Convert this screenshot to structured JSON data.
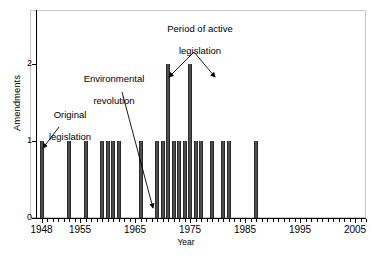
{
  "chart_data": {
    "type": "bar",
    "title": "",
    "xlabel": "Year",
    "ylabel": "Amendments",
    "xlim": [
      1947,
      2007
    ],
    "ylim": [
      0,
      2.7
    ],
    "yticks": [
      0,
      1,
      2
    ],
    "ytick_labels": [
      "0",
      "1",
      "2"
    ],
    "xtick_labels": [
      "1948",
      "1955",
      "1965",
      "1975",
      "1985",
      "1995",
      "2005"
    ],
    "xtick_values": [
      1948,
      1955,
      1965,
      1975,
      1985,
      1995,
      2005
    ],
    "grid": false,
    "legend": null,
    "bar_color": "#2b2b2b",
    "categories": [
      1948,
      1953,
      1956,
      1959,
      1960,
      1961,
      1962,
      1966,
      1969,
      1970,
      1971,
      1972,
      1973,
      1974,
      1975,
      1976,
      1977,
      1979,
      1981,
      1982,
      1987
    ],
    "values": [
      1,
      1,
      1,
      1,
      1,
      1,
      1,
      1,
      1,
      1,
      2,
      1,
      1,
      1,
      2,
      1,
      1,
      1,
      1,
      1,
      1
    ],
    "annotations": [
      {
        "id": "original-legislation",
        "text": "Original\nlegislation",
        "points_to_year": 1948,
        "points_to_value": 1
      },
      {
        "id": "environmental-revolution",
        "text": "Environmental\nrevolution",
        "points_to_year": 1969,
        "points_to_value": 0
      },
      {
        "id": "period-of-active-legislation",
        "text": "Period of active\nlegislation",
        "points_to_year": 1971,
        "points_to_value": 2
      }
    ]
  },
  "axes": {
    "y_title": "Amendments",
    "x_title": "Year",
    "y_ticks": [
      {
        "label": "2",
        "value": 2
      },
      {
        "label": "1",
        "value": 1
      },
      {
        "label": "0",
        "value": 0
      }
    ],
    "x_ticks": [
      {
        "label": "1948",
        "value": 1948
      },
      {
        "label": "1955",
        "value": 1955
      },
      {
        "label": "1965",
        "value": 1965
      },
      {
        "label": "1975",
        "value": 1975
      },
      {
        "label": "1985",
        "value": 1985
      },
      {
        "label": "1995",
        "value": 1995
      },
      {
        "label": "2005",
        "value": 2005
      }
    ]
  },
  "annotations": {
    "original": {
      "line1": "Original",
      "line2": "legislation"
    },
    "environmental": {
      "line1": "Environmental",
      "line2": "revolution"
    },
    "period": {
      "line1": "Period of active",
      "line2": "legislation"
    }
  }
}
